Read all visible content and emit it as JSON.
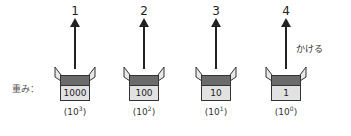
{
  "labels": {
    "weight": "重み：",
    "multiply": "かける"
  },
  "columns": [
    {
      "position": "1",
      "value": "1000",
      "exp_base": "10",
      "exp_power": "3"
    },
    {
      "position": "2",
      "value": "100",
      "exp_base": "10",
      "exp_power": "2"
    },
    {
      "position": "3",
      "value": "10",
      "exp_base": "10",
      "exp_power": "1"
    },
    {
      "position": "4",
      "value": "1",
      "exp_base": "10",
      "exp_power": "0"
    }
  ],
  "colors": {
    "lid": "#6b6b6b",
    "body": "#e2e2e2",
    "stroke": "#222222"
  }
}
